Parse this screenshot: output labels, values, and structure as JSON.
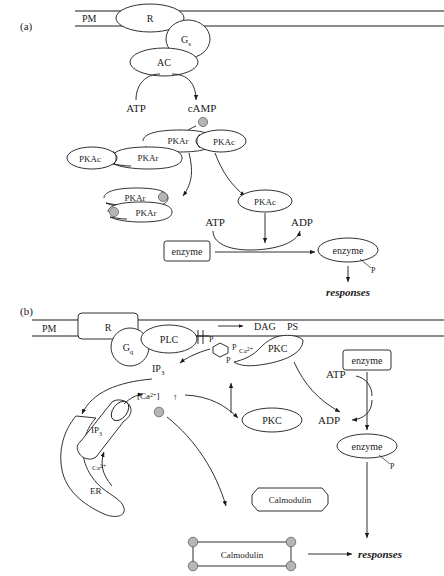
{
  "figure": {
    "panel_a": {
      "label": "(a)",
      "membrane_label": "PM",
      "receptor": "R",
      "g_protein": "G",
      "g_protein_sub": "s",
      "adenylyl_cyclase": "AC",
      "substrate": "ATP",
      "product": "cAMP",
      "pka_holoenzyme": {
        "regulatory_1": "PKAr",
        "regulatory_2": "PKAr",
        "catalytic_1": "PKAc",
        "catalytic_2": "PKAc"
      },
      "pkar_bound": {
        "regulatory_1": "PKAr",
        "regulatory_2": "PKAr"
      },
      "free_catalytic": "PKAc",
      "kinase_atp": "ATP",
      "kinase_adp": "ADP",
      "enzyme_inactive": "enzyme",
      "enzyme_active": "enzyme",
      "phosphate": "P",
      "outcome": "responses"
    },
    "panel_b": {
      "label": "(b)",
      "membrane_label": "PM",
      "receptor": "R",
      "g_protein": "G",
      "g_protein_sub": "q",
      "phospholipase": "PLC",
      "dag": "DAG",
      "ps": "PS",
      "ip3_phosphates": [
        "P",
        "P",
        "P"
      ],
      "ip3": "IP",
      "ip3_sub": "3",
      "calcium_membrane": "Ca",
      "calcium_membrane_sup": "2+",
      "pkc_membrane": "PKC",
      "pkc_cytosol": "PKC",
      "calcium_conc": "[Ca",
      "calcium_conc_sup": "2+",
      "calcium_conc_tail": "]",
      "calcium_arrow": "↑",
      "ip3_receptor": "IP",
      "ip3_receptor_sub": "3",
      "er_calcium": "Ca",
      "er_calcium_sup": "2+",
      "er": "ER",
      "calmodulin_free": "Calmodulin",
      "calmodulin_bound": "Calmodulin",
      "enzyme_inactive": "enzyme",
      "enzyme_active": "enzyme",
      "kinase_atp": "ATP",
      "kinase_adp": "ADP",
      "phosphate": "P",
      "outcome": "responses"
    }
  }
}
